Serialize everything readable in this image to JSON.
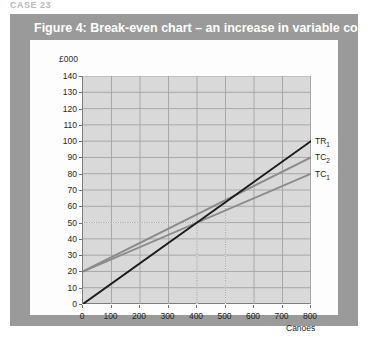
{
  "top_fragment": "CASE 23",
  "figure": {
    "title": "Figure 4: Break-even chart – an increase in variable costs",
    "frame_color": "#9a9a9a",
    "title_color": "#ffffff",
    "panel_color": "#fdfdfd"
  },
  "chart_data": {
    "type": "line",
    "title": "Figure 4: Break-even chart – an increase in variable costs",
    "xlabel": "Canoes",
    "ylabel": "£000",
    "xlim": [
      0,
      800
    ],
    "ylim": [
      0,
      140
    ],
    "grid": true,
    "legend_position": "right-of-line-ends",
    "x_ticks": [
      0,
      100,
      200,
      300,
      400,
      500,
      600,
      700,
      800
    ],
    "y_ticks": [
      0,
      10,
      20,
      30,
      40,
      50,
      60,
      70,
      80,
      90,
      100,
      110,
      120,
      130,
      140
    ],
    "x": [
      0,
      800
    ],
    "series": [
      {
        "name": "TR₁",
        "label_text": "TR",
        "label_sub": "1",
        "values": [
          0,
          100
        ],
        "color": "#1c1c1c",
        "width": 1.9
      },
      {
        "name": "TC₂",
        "label_text": "TC",
        "label_sub": "2",
        "values": [
          20,
          90
        ],
        "color": "#8b8b8b",
        "width": 1.9
      },
      {
        "name": "TC₁",
        "label_text": "TC",
        "label_sub": "1",
        "values": [
          20,
          80
        ],
        "color": "#8b8b8b",
        "width": 1.9
      }
    ],
    "annotations": [
      {
        "type": "hline",
        "y": 50,
        "x_from": 0,
        "x_to": 400,
        "style": "dotted",
        "color": "#f4f4f4"
      },
      {
        "type": "vline",
        "x": 400,
        "y_from": 0,
        "y_to": 50,
        "style": "dotted",
        "color": "#f4f4f4"
      },
      {
        "type": "vline",
        "x": 500,
        "y_from": 0,
        "y_to": 62,
        "style": "dotted",
        "color": "#f4f4f4"
      }
    ],
    "plot_bg": "#d9d9d9",
    "gridline_color": "#a8a8a8",
    "axis_color": "#7d7d7d"
  }
}
